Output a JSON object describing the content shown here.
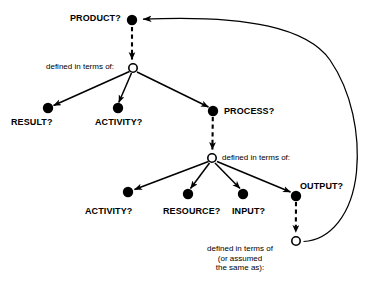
{
  "diagram": {
    "type": "node-link-graph",
    "title": "",
    "nodes": [
      {
        "id": "product",
        "label": "PRODUCT?",
        "kind": "filled-dot",
        "x": 132,
        "y": 20,
        "label_x": 70,
        "label_y": 13
      },
      {
        "id": "defn1",
        "label": "",
        "kind": "open-circle",
        "x": 133,
        "y": 68
      },
      {
        "id": "result",
        "label": "RESULT?",
        "kind": "filled-dot",
        "x": 48,
        "y": 108,
        "label_x": 11,
        "label_y": 117
      },
      {
        "id": "activity1",
        "label": "ACTIVITY?",
        "kind": "filled-dot",
        "x": 118,
        "y": 108,
        "label_x": 95,
        "label_y": 117
      },
      {
        "id": "process",
        "label": "PROCESS?",
        "kind": "filled-dot",
        "x": 213,
        "y": 111,
        "label_x": 224,
        "label_y": 106
      },
      {
        "id": "defn2",
        "label": "",
        "kind": "open-circle",
        "x": 212,
        "y": 158
      },
      {
        "id": "activity2",
        "label": "ACTIVITY?",
        "kind": "filled-dot",
        "x": 128,
        "y": 192,
        "label_x": 85,
        "label_y": 206
      },
      {
        "id": "resource",
        "label": "RESOURCE?",
        "kind": "filled-dot",
        "x": 188,
        "y": 194,
        "label_x": 163,
        "label_y": 206
      },
      {
        "id": "input",
        "label": "INPUT?",
        "kind": "filled-dot",
        "x": 243,
        "y": 194,
        "label_x": 232,
        "label_y": 206
      },
      {
        "id": "output",
        "label": "OUTPUT?",
        "kind": "filled-dot",
        "x": 296,
        "y": 196,
        "label_x": 300,
        "label_y": 181
      },
      {
        "id": "defn3",
        "label": "",
        "kind": "open-circle",
        "x": 296,
        "y": 241
      }
    ],
    "relation_labels": [
      {
        "id": "rel1",
        "text": "defined in terms of:",
        "x": 46,
        "y": 62,
        "align": "left"
      },
      {
        "id": "rel2",
        "text": "defined in terms of:",
        "x": 222,
        "y": 153,
        "align": "left"
      },
      {
        "id": "rel3",
        "line1": "defined in terms of",
        "line2": "(or assumed",
        "line3": "the same as):",
        "x": 198,
        "y": 244,
        "align": "center"
      }
    ],
    "edges": [
      {
        "from": "product",
        "to": "defn1",
        "style": "dashed",
        "arrow": true
      },
      {
        "from": "defn1",
        "to": "result",
        "style": "solid",
        "arrow": true
      },
      {
        "from": "defn1",
        "to": "activity1",
        "style": "solid",
        "arrow": true
      },
      {
        "from": "defn1",
        "to": "process",
        "style": "solid",
        "arrow": true
      },
      {
        "from": "process",
        "to": "defn2",
        "style": "dashed",
        "arrow": true
      },
      {
        "from": "defn2",
        "to": "activity2",
        "style": "solid",
        "arrow": true
      },
      {
        "from": "defn2",
        "to": "resource",
        "style": "solid",
        "arrow": true
      },
      {
        "from": "defn2",
        "to": "input",
        "style": "solid",
        "arrow": true
      },
      {
        "from": "defn2",
        "to": "output",
        "style": "solid",
        "arrow": true
      },
      {
        "from": "output",
        "to": "defn3",
        "style": "dashed",
        "arrow": true
      },
      {
        "from": "defn3",
        "to": "product",
        "style": "curve",
        "arrow": true
      }
    ],
    "colors": {
      "stroke": "#000000",
      "fill_node": "#000000",
      "open_node_fill": "#ffffff",
      "background": "#ffffff",
      "text": "#000000"
    }
  }
}
